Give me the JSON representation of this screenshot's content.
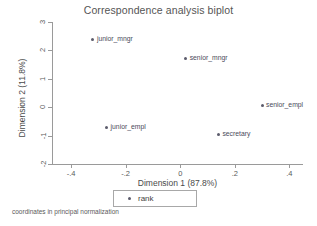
{
  "chart_data": {
    "type": "scatter",
    "title": "Correspondence analysis biplot",
    "xlabel": "Dimension 1 (87.8%)",
    "ylabel": "Dimension 2 (11.8%)",
    "xlim": [
      -0.47,
      0.45
    ],
    "ylim": [
      -2.0,
      3.0
    ],
    "xticks": [
      "-.4",
      "-.2",
      "0",
      ".2",
      ".4"
    ],
    "xtick_values": [
      -0.4,
      -0.2,
      0,
      0.2,
      0.4
    ],
    "yticks": [
      "3",
      "2",
      "1",
      "0",
      "-1",
      "-2"
    ],
    "ytick_values": [
      3,
      2,
      1,
      0,
      -1,
      -2
    ],
    "grid": false,
    "legend_position": "bottom-center",
    "series": [
      {
        "name": "rank",
        "marker_color": "#5b5b6b",
        "points": [
          {
            "label": "junior_mngr",
            "x": -0.32,
            "y": 2.37,
            "label_side": "right"
          },
          {
            "label": "senior_mngr",
            "x": 0.02,
            "y": 1.72,
            "label_side": "right"
          },
          {
            "label": "senior_empl",
            "x": 0.3,
            "y": 0.05,
            "label_side": "right"
          },
          {
            "label": "junior_empl",
            "x": -0.27,
            "y": -0.71,
            "label_side": "right"
          },
          {
            "label": "secretary",
            "x": 0.14,
            "y": -0.96,
            "label_side": "right"
          }
        ]
      }
    ],
    "note": "coordinates in principal normalization"
  },
  "legend": {
    "entries": [
      {
        "label": "rank",
        "marker": "filled-circle-marker",
        "color": "#5b5b6b"
      }
    ]
  },
  "colors": {
    "background": "#ffffff",
    "axis": "#9a9a9a",
    "text": "#4a4a4a",
    "marker": "#5b5b6b"
  }
}
